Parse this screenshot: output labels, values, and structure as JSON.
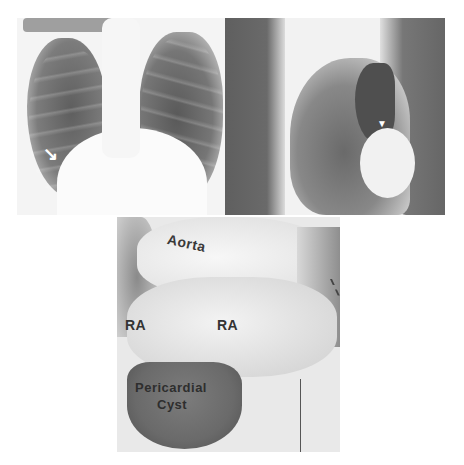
{
  "figure": {
    "panels": [
      {
        "id": "pa-xray",
        "description": "Posteroanterior chest radiograph",
        "marker": "arrow"
      },
      {
        "id": "lateral-xray",
        "description": "Lateral chest radiograph",
        "marker": "arrowhead"
      },
      {
        "id": "specimen-photo",
        "description": "Operative/specimen photograph"
      }
    ],
    "markers": {
      "arrow": "↘",
      "arrowhead": "▼"
    },
    "labels": {
      "aorta": "Aorta",
      "ra_left": "RA",
      "ra_right": "RA",
      "cyst_line1": "Pericardial",
      "cyst_line2": "Cyst"
    }
  }
}
